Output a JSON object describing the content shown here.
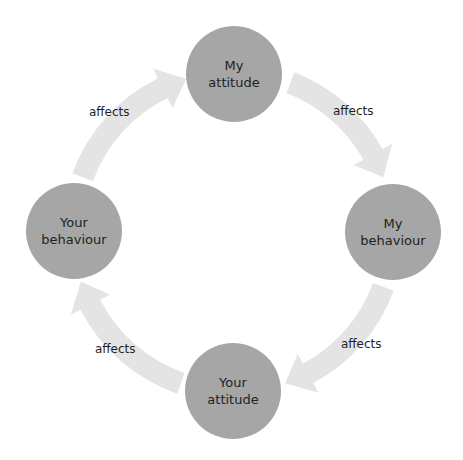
{
  "diagram": {
    "type": "cycle",
    "nodes": [
      {
        "id": "my-attitude",
        "line1": "My",
        "line2": "attitude"
      },
      {
        "id": "my-behaviour",
        "line1": "My",
        "line2": "behaviour"
      },
      {
        "id": "your-attitude",
        "line1": "Your",
        "line2": "attitude"
      },
      {
        "id": "your-behaviour",
        "line1": "Your",
        "line2": "behaviour"
      }
    ],
    "edges": [
      {
        "from": "your-behaviour",
        "to": "my-attitude",
        "label": "affects"
      },
      {
        "from": "my-attitude",
        "to": "my-behaviour",
        "label": "affects"
      },
      {
        "from": "my-behaviour",
        "to": "your-attitude",
        "label": "affects"
      },
      {
        "from": "your-attitude",
        "to": "your-behaviour",
        "label": "affects"
      }
    ],
    "colors": {
      "node": "#a6a6a6",
      "arrow": "#e4e4e4",
      "text": "#1f1f1f"
    }
  }
}
